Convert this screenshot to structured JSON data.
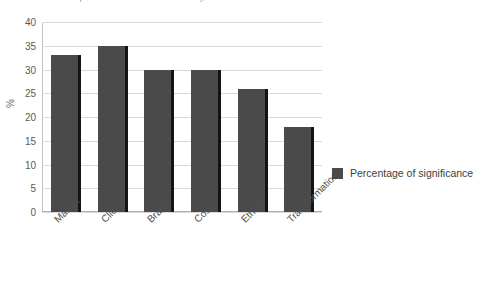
{
  "caption": {
    "text": "Source: Data compiled from research and consultancy, 2018"
  },
  "chart_data": {
    "type": "bar",
    "title": "",
    "subtitle": "",
    "xlabel": "",
    "ylabel": "%",
    "categories": [
      "Market",
      "Client",
      "Brand",
      "Cost",
      "Ethics",
      "Transformation"
    ],
    "values": [
      33,
      35,
      30,
      30,
      26,
      18
    ],
    "series": [
      {
        "name": "Percentage of significance",
        "values": [
          33,
          35,
          30,
          30,
          26,
          18
        ]
      }
    ],
    "ylim": [
      0,
      40
    ],
    "ytick_step": 5,
    "yticks": [
      "40",
      "35",
      "30",
      "25",
      "20",
      "15",
      "10",
      "5",
      "0"
    ],
    "grid": true,
    "legend_position": "right",
    "legend_entries": [
      "Percentage of significance"
    ],
    "bar_color": "#4a4a4a",
    "bar_edge_color": "#141414",
    "grid_color": "#d9d9d9",
    "background_color": "#ffffff"
  }
}
